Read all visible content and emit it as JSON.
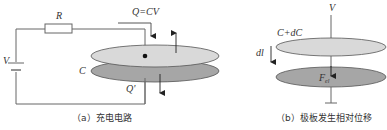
{
  "panel_a": {
    "caption": "（a）充电电路",
    "labels": {
      "resistor": "R",
      "source": "V",
      "capacitor": "C",
      "charge_top": "Q=CV",
      "charge_bottom": "Q'"
    }
  },
  "panel_b": {
    "caption": "（b）极板发生相对位移",
    "labels": {
      "voltage": "V",
      "capacitance": "C+dC",
      "displacement": "dl",
      "force": "F",
      "force_sub": "el"
    }
  },
  "colors": {
    "wire": "#666666",
    "top_plate": "#d9d9d9",
    "bottom_plate": "#a6a6a6",
    "plate_edge": "#555555",
    "text": "#333333"
  }
}
